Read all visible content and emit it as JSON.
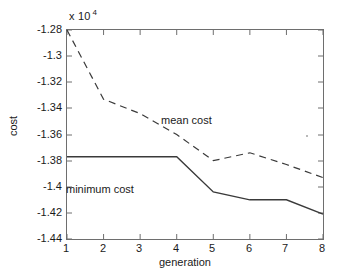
{
  "chart_data": {
    "type": "line",
    "title": "",
    "xlabel": "generation",
    "ylabel": "cost",
    "y_multiplier": "x 10",
    "y_multiplier_exponent": "4",
    "x": [
      1,
      2,
      3,
      4,
      5,
      6,
      7,
      8
    ],
    "xlim": [
      1,
      8
    ],
    "ylim": [
      -1.44,
      -1.28
    ],
    "xticks": [
      "1",
      "2",
      "3",
      "4",
      "5",
      "6",
      "7",
      "8"
    ],
    "yticks": [
      "-1.28",
      "-1.3",
      "-1.32",
      "-1.34",
      "-1.36",
      "-1.38",
      "-1.4",
      "-1.42",
      "-1.44"
    ],
    "ytick_values": [
      -1.28,
      -1.3,
      -1.32,
      -1.34,
      -1.36,
      -1.38,
      -1.4,
      -1.42,
      -1.44
    ],
    "grid": false,
    "legend_position": "inline-annotations",
    "series": [
      {
        "name": "mean cost",
        "style": "dashed",
        "color": "#3a3a3a",
        "values": [
          -1.28,
          -1.333,
          -1.344,
          -1.36,
          -1.38,
          -1.374,
          -1.383,
          -1.393
        ]
      },
      {
        "name": "minimum cost",
        "style": "solid",
        "color": "#3a3a3a",
        "values": [
          -1.377,
          -1.377,
          -1.377,
          -1.377,
          -1.404,
          -1.41,
          -1.41,
          -1.421
        ]
      }
    ],
    "annotations": [
      {
        "text": "mean cost",
        "x": 3.6,
        "y": -1.3545
      },
      {
        "text": "minimum cost",
        "x": 1.0,
        "y": -1.4025
      }
    ]
  }
}
